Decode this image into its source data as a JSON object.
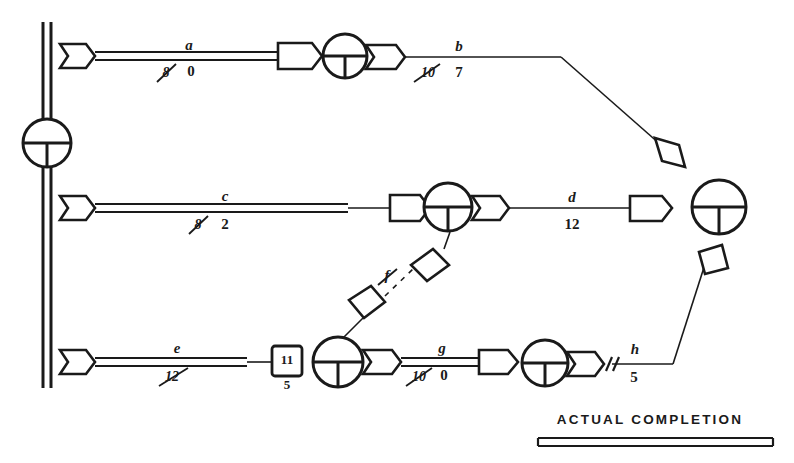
{
  "diagram": {
    "type": "pert-cpm-network-progress-chart",
    "title_visible": false,
    "ink_color": "#1a1a1a",
    "background_color": "#ffffff",
    "legend": {
      "label": "ACTUAL COMPLETION",
      "symbol": "double-line-bar"
    },
    "nodes": [
      {
        "id": "n-start",
        "name": "start-event-node",
        "cx": 47,
        "cy": 143,
        "r": 24
      },
      {
        "id": "n-top-mid",
        "name": "top-row-event-node",
        "cx": 345,
        "cy": 56,
        "r": 22
      },
      {
        "id": "n-mid-mid",
        "name": "middle-row-event-node",
        "cx": 448,
        "cy": 207,
        "r": 24
      },
      {
        "id": "n-bot-left",
        "name": "bottom-row-event-node-1",
        "cx": 338,
        "cy": 362,
        "r": 25
      },
      {
        "id": "n-bot-right",
        "name": "bottom-row-event-node-2",
        "cx": 545,
        "cy": 363,
        "r": 23
      },
      {
        "id": "n-finish",
        "name": "finish-event-node",
        "cx": 719,
        "cy": 207,
        "r": 27
      }
    ],
    "activities": [
      {
        "id": "a",
        "name": "activity-a",
        "label": "a",
        "original_duration": "8",
        "original_struck": true,
        "revised_duration": "0",
        "progress": "complete",
        "row": "top"
      },
      {
        "id": "b",
        "name": "activity-b",
        "label": "b",
        "original_duration": "10",
        "original_struck": true,
        "revised_duration": "7",
        "progress": "not-started",
        "row": "top"
      },
      {
        "id": "c",
        "name": "activity-c",
        "label": "c",
        "original_duration": "8",
        "original_struck": true,
        "revised_duration": "2",
        "progress": "partial",
        "row": "middle"
      },
      {
        "id": "d",
        "name": "activity-d",
        "label": "d",
        "original_duration": "",
        "original_struck": false,
        "revised_duration": "12",
        "progress": "not-started",
        "row": "middle"
      },
      {
        "id": "e",
        "name": "activity-e",
        "label": "e",
        "original_duration": "12",
        "original_struck": true,
        "revised_duration": "",
        "progress": "partial",
        "row": "bottom"
      },
      {
        "id": "f",
        "name": "activity-f-dummy",
        "label": "f",
        "original_duration": "",
        "original_struck": true,
        "revised_duration": "",
        "progress": "not-started",
        "row": "diagonal"
      },
      {
        "id": "g",
        "name": "activity-g",
        "label": "g",
        "original_duration": "10",
        "original_struck": true,
        "revised_duration": "0",
        "progress": "complete",
        "row": "bottom"
      },
      {
        "id": "h",
        "name": "activity-h",
        "label": "h",
        "original_duration": "",
        "original_struck": false,
        "revised_duration": "5",
        "progress": "not-started",
        "row": "bottom"
      }
    ],
    "status_box": {
      "name": "status-box-e",
      "value": "11",
      "sub_value": "5"
    },
    "progress_tick": {
      "name": "progress-tick-mark-h",
      "symbol": "//"
    }
  }
}
